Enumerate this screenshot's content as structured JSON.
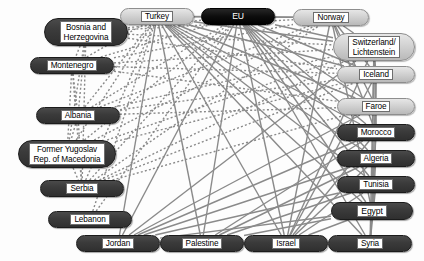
{
  "diagram": {
    "type": "network-graph",
    "canvas": {
      "width": 424,
      "height": 261,
      "background": "#fdfdfd"
    },
    "styles": {
      "dark_fill": "#3b3b3b",
      "light_fill": "#d2d2d2",
      "black_fill": "#000000",
      "label_background": "#ffffff",
      "label_text": "#000000",
      "black_label_text": "#ffffff",
      "edge_color": "#8a8a8a",
      "edge_solid_width": 1.4,
      "edge_dotted_width": 1.4
    },
    "nodes": [
      {
        "id": "bosnia",
        "label": "Bosnia and\nHerzegovina",
        "style": "dark",
        "x": 44,
        "y": 18,
        "w": 84,
        "h": 28,
        "font": 8.2,
        "lines": 2
      },
      {
        "id": "montenegro",
        "label": "Montenegro",
        "style": "dark",
        "x": 30,
        "y": 57,
        "w": 84,
        "h": 17,
        "font": 8.2,
        "lines": 1
      },
      {
        "id": "albania",
        "label": "Albania",
        "style": "dark",
        "x": 36,
        "y": 107,
        "w": 84,
        "h": 17,
        "font": 8.2,
        "lines": 1
      },
      {
        "id": "macedonia",
        "label": "Former Yugoslav\nRep. of Macedonia",
        "style": "dark",
        "x": 18,
        "y": 140,
        "w": 98,
        "h": 28,
        "font": 8.2,
        "lines": 2
      },
      {
        "id": "serbia",
        "label": "Serbia",
        "style": "dark",
        "x": 40,
        "y": 180,
        "w": 84,
        "h": 17,
        "font": 8.2,
        "lines": 1
      },
      {
        "id": "lebanon",
        "label": "Lebanon",
        "style": "dark",
        "x": 48,
        "y": 211,
        "w": 84,
        "h": 17,
        "font": 8.2,
        "lines": 1
      },
      {
        "id": "turkey",
        "label": "Turkey",
        "style": "light",
        "x": 120,
        "y": 8,
        "w": 74,
        "h": 17,
        "font": 8.2,
        "lines": 1
      },
      {
        "id": "eu",
        "label": "EU",
        "style": "black",
        "x": 201,
        "y": 8,
        "w": 74,
        "h": 17,
        "font": 8.6,
        "lines": 1
      },
      {
        "id": "norway",
        "label": "Norway",
        "style": "light",
        "x": 293,
        "y": 9,
        "w": 76,
        "h": 17,
        "font": 8.2,
        "lines": 1
      },
      {
        "id": "switzerland",
        "label": "Switzerland/\nLichtenstein",
        "style": "light",
        "x": 333,
        "y": 33,
        "w": 82,
        "h": 28,
        "font": 8.2,
        "lines": 2
      },
      {
        "id": "iceland",
        "label": "Iceland",
        "style": "light",
        "x": 337,
        "y": 66,
        "w": 78,
        "h": 17,
        "font": 8.2,
        "lines": 1
      },
      {
        "id": "faroe",
        "label": "Faroe",
        "style": "light",
        "x": 337,
        "y": 98,
        "w": 78,
        "h": 17,
        "font": 8.2,
        "lines": 1
      },
      {
        "id": "morocco",
        "label": "Morocco",
        "style": "dark",
        "x": 337,
        "y": 124,
        "w": 78,
        "h": 17,
        "font": 8.2,
        "lines": 1
      },
      {
        "id": "algeria",
        "label": "Algeria",
        "style": "dark",
        "x": 337,
        "y": 150,
        "w": 78,
        "h": 17,
        "font": 8.2,
        "lines": 1
      },
      {
        "id": "tunisia",
        "label": "Tunisia",
        "style": "dark",
        "x": 337,
        "y": 176,
        "w": 78,
        "h": 17,
        "font": 8.2,
        "lines": 1
      },
      {
        "id": "egypt",
        "label": "Egypt",
        "style": "dark",
        "x": 331,
        "y": 202,
        "w": 82,
        "h": 18,
        "font": 8.6,
        "lines": 1
      },
      {
        "id": "jordan",
        "label": "Jordan",
        "style": "dark",
        "x": 76,
        "y": 235,
        "w": 84,
        "h": 17,
        "font": 8.2,
        "lines": 1
      },
      {
        "id": "palestine",
        "label": "Palestine",
        "style": "dark",
        "x": 160,
        "y": 235,
        "w": 84,
        "h": 17,
        "font": 8.2,
        "lines": 1
      },
      {
        "id": "israel",
        "label": "Israel",
        "style": "dark",
        "x": 244,
        "y": 235,
        "w": 84,
        "h": 17,
        "font": 8.2,
        "lines": 1
      },
      {
        "id": "syria",
        "label": "Syria",
        "style": "dark",
        "x": 328,
        "y": 235,
        "w": 84,
        "h": 17,
        "font": 8.2,
        "lines": 1
      }
    ],
    "edges_solid": [
      [
        "turkey",
        "eu"
      ],
      [
        "turkey",
        "norway"
      ],
      [
        "turkey",
        "switzerland"
      ],
      [
        "turkey",
        "iceland"
      ],
      [
        "turkey",
        "faroe"
      ],
      [
        "turkey",
        "morocco"
      ],
      [
        "turkey",
        "algeria"
      ],
      [
        "turkey",
        "tunisia"
      ],
      [
        "turkey",
        "egypt"
      ],
      [
        "turkey",
        "jordan"
      ],
      [
        "turkey",
        "palestine"
      ],
      [
        "turkey",
        "israel"
      ],
      [
        "turkey",
        "syria"
      ],
      [
        "eu",
        "norway"
      ],
      [
        "eu",
        "switzerland"
      ],
      [
        "eu",
        "iceland"
      ],
      [
        "eu",
        "faroe"
      ],
      [
        "eu",
        "morocco"
      ],
      [
        "eu",
        "algeria"
      ],
      [
        "eu",
        "tunisia"
      ],
      [
        "eu",
        "egypt"
      ],
      [
        "eu",
        "jordan"
      ],
      [
        "eu",
        "palestine"
      ],
      [
        "eu",
        "israel"
      ],
      [
        "eu",
        "syria"
      ],
      [
        "norway",
        "switzerland"
      ],
      [
        "norway",
        "iceland"
      ],
      [
        "norway",
        "faroe"
      ],
      [
        "norway",
        "morocco"
      ],
      [
        "norway",
        "egypt"
      ],
      [
        "norway",
        "israel"
      ],
      [
        "switzerland",
        "iceland"
      ],
      [
        "switzerland",
        "morocco"
      ],
      [
        "switzerland",
        "egypt"
      ],
      [
        "switzerland",
        "jordan"
      ],
      [
        "switzerland",
        "israel"
      ],
      [
        "switzerland",
        "syria"
      ],
      [
        "iceland",
        "faroe"
      ],
      [
        "iceland",
        "egypt"
      ],
      [
        "iceland",
        "israel"
      ],
      [
        "faroe",
        "morocco"
      ],
      [
        "faroe",
        "jordan"
      ],
      [
        "morocco",
        "egypt"
      ],
      [
        "morocco",
        "jordan"
      ],
      [
        "morocco",
        "israel"
      ],
      [
        "morocco",
        "palestine"
      ],
      [
        "algeria",
        "jordan"
      ],
      [
        "algeria",
        "palestine"
      ],
      [
        "algeria",
        "israel"
      ],
      [
        "tunisia",
        "jordan"
      ],
      [
        "tunisia",
        "palestine"
      ],
      [
        "tunisia",
        "israel"
      ],
      [
        "tunisia",
        "egypt"
      ],
      [
        "egypt",
        "jordan"
      ],
      [
        "egypt",
        "palestine"
      ],
      [
        "egypt",
        "israel"
      ],
      [
        "egypt",
        "syria"
      ],
      [
        "jordan",
        "palestine"
      ],
      [
        "jordan",
        "israel"
      ],
      [
        "jordan",
        "syria"
      ],
      [
        "palestine",
        "israel"
      ],
      [
        "palestine",
        "syria"
      ],
      [
        "israel",
        "syria"
      ],
      [
        "morocco",
        "syria"
      ],
      [
        "algeria",
        "syria"
      ],
      [
        "tunisia",
        "syria"
      ]
    ],
    "edges_dotted": [
      [
        "bosnia",
        "turkey"
      ],
      [
        "bosnia",
        "eu"
      ],
      [
        "bosnia",
        "montenegro"
      ],
      [
        "bosnia",
        "albania"
      ],
      [
        "bosnia",
        "macedonia"
      ],
      [
        "bosnia",
        "serbia"
      ],
      [
        "montenegro",
        "turkey"
      ],
      [
        "montenegro",
        "eu"
      ],
      [
        "montenegro",
        "albania"
      ],
      [
        "montenegro",
        "macedonia"
      ],
      [
        "montenegro",
        "serbia"
      ],
      [
        "albania",
        "turkey"
      ],
      [
        "albania",
        "eu"
      ],
      [
        "albania",
        "macedonia"
      ],
      [
        "albania",
        "serbia"
      ],
      [
        "macedonia",
        "turkey"
      ],
      [
        "macedonia",
        "eu"
      ],
      [
        "macedonia",
        "serbia"
      ],
      [
        "serbia",
        "turkey"
      ],
      [
        "serbia",
        "eu"
      ],
      [
        "lebanon",
        "turkey"
      ],
      [
        "lebanon",
        "eu"
      ],
      [
        "bosnia",
        "norway"
      ],
      [
        "montenegro",
        "norway"
      ],
      [
        "albania",
        "norway"
      ],
      [
        "macedonia",
        "norway"
      ],
      [
        "serbia",
        "norway"
      ],
      [
        "bosnia",
        "switzerland"
      ],
      [
        "montenegro",
        "switzerland"
      ],
      [
        "albania",
        "switzerland"
      ],
      [
        "macedonia",
        "switzerland"
      ],
      [
        "serbia",
        "switzerland"
      ],
      [
        "bosnia",
        "iceland"
      ],
      [
        "montenegro",
        "iceland"
      ],
      [
        "albania",
        "iceland"
      ],
      [
        "serbia",
        "iceland"
      ],
      [
        "macedonia",
        "iceland"
      ],
      [
        "albania",
        "faroe"
      ],
      [
        "serbia",
        "faroe"
      ],
      [
        "montenegro",
        "faroe"
      ]
    ]
  }
}
